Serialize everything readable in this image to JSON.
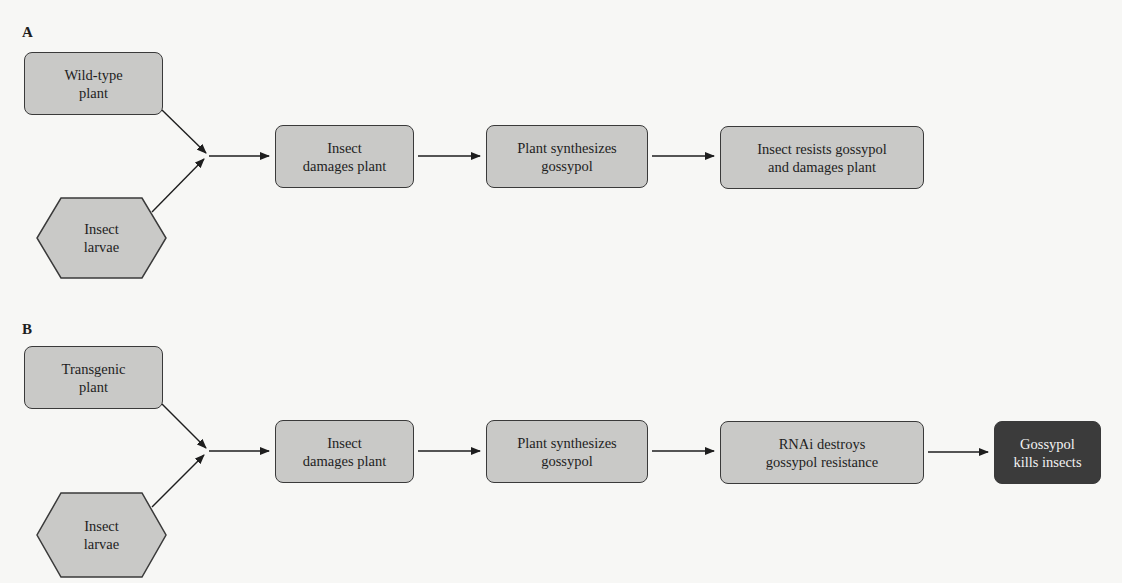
{
  "panels": [
    {
      "label": "A",
      "inputs": {
        "plant": "Wild-type\nplant",
        "insect": "Insect\nlarvae"
      },
      "steps": [
        "Insect\ndamages plant",
        "Plant synthesizes\ngossypol",
        "Insect resists gossypol\nand damages plant"
      ]
    },
    {
      "label": "B",
      "inputs": {
        "plant": "Transgenic\nplant",
        "insect": "Insect\nlarvae"
      },
      "steps": [
        "Insect\ndamages plant",
        "Plant synthesizes\ngossypol",
        "RNAi destroys\ngossypol resistance"
      ],
      "outcome": "Gossypol\nkills insects"
    }
  ],
  "colors": {
    "box_fill": "#c9c9c7",
    "box_border": "#3a3a3a",
    "outcome_fill": "#3b3b3b",
    "outcome_text": "#f2f2f2",
    "background": "#f7f7f5"
  }
}
